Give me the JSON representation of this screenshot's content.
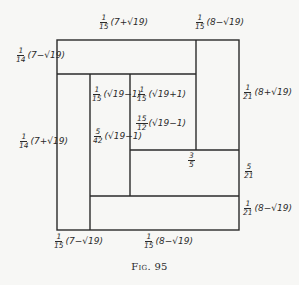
{
  "figure": {
    "caption": "Fig. 95",
    "line_color": "#2a2a2a"
  },
  "labels": {
    "top_left": {
      "num": "1",
      "den": "15",
      "expr": "(7+√19)"
    },
    "top_right": {
      "num": "1",
      "den": "15",
      "expr": "(8−√19)"
    },
    "left_top": {
      "num": "1",
      "den": "14",
      "expr": "(7−√19)"
    },
    "left_bottom": {
      "num": "1",
      "den": "14",
      "expr": "(7+√19)"
    },
    "right_top": {
      "num": "1",
      "den": "21",
      "expr": "(8+√19)"
    },
    "right_mid": {
      "num": "5",
      "den": "21",
      "expr": ""
    },
    "right_bottom": {
      "num": "1",
      "den": "21",
      "expr": "(8−√19)"
    },
    "bottom_left": {
      "num": "1",
      "den": "15",
      "expr": "(7−√19)"
    },
    "bottom_mid": {
      "num": "1",
      "den": "15",
      "expr": "(8−√19)"
    },
    "inner_a": {
      "num": "1",
      "den": "15",
      "expr": "(√19−1)"
    },
    "inner_b": {
      "num": "1",
      "den": "15",
      "expr": "(√19+1)"
    },
    "inner_c": {
      "num": "15",
      "den": "12",
      "expr": "(√19−1)"
    },
    "inner_d": {
      "num": "5",
      "den": "42",
      "expr": "(√19−1)"
    },
    "inner_e": {
      "num": "3",
      "den": "5",
      "expr": ""
    }
  }
}
